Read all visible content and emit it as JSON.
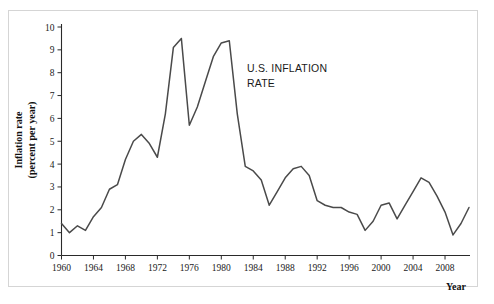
{
  "chart_data": {
    "type": "line",
    "title": "",
    "annotation": "U.S. INFLATION RATE",
    "annotation_lines": [
      "U.S. INFLATION",
      "RATE"
    ],
    "xlabel": "Year",
    "ylabel": "Inflation rate (percent per year)",
    "ylabel_lines": [
      "Inflation rate",
      "(percent per year)"
    ],
    "xlim": [
      1960,
      2011
    ],
    "ylim": [
      0,
      10
    ],
    "grid": false,
    "legend": null,
    "line_color": "#4a4a4a",
    "x_tick_labels": [
      "1960",
      "1964",
      "1968",
      "1972",
      "1976",
      "1980",
      "1984",
      "1988",
      "1992",
      "1996",
      "2000",
      "2004",
      "2008"
    ],
    "x_ticks": [
      1960,
      1964,
      1968,
      1972,
      1976,
      1980,
      1984,
      1988,
      1992,
      1996,
      2000,
      2004,
      2008
    ],
    "y_tick_labels": [
      "0",
      "1",
      "2",
      "3",
      "4",
      "5",
      "6",
      "7",
      "8",
      "9",
      "10"
    ],
    "y_ticks": [
      0,
      1,
      2,
      3,
      4,
      5,
      6,
      7,
      8,
      9,
      10
    ],
    "x": [
      1960,
      1961,
      1962,
      1963,
      1964,
      1965,
      1966,
      1967,
      1968,
      1969,
      1970,
      1971,
      1972,
      1973,
      1974,
      1975,
      1976,
      1977,
      1978,
      1979,
      1980,
      1981,
      1982,
      1983,
      1984,
      1985,
      1986,
      1987,
      1988,
      1989,
      1990,
      1991,
      1992,
      1993,
      1994,
      1995,
      1996,
      1997,
      1998,
      1999,
      2000,
      2001,
      2002,
      2003,
      2004,
      2005,
      2006,
      2007,
      2008,
      2009,
      2010,
      2011
    ],
    "values": [
      1.4,
      1.0,
      1.3,
      1.1,
      1.7,
      2.1,
      2.9,
      3.1,
      4.2,
      5.0,
      5.3,
      4.9,
      4.3,
      6.2,
      9.1,
      9.5,
      5.7,
      6.5,
      7.6,
      8.7,
      9.3,
      9.4,
      6.2,
      3.9,
      3.7,
      3.3,
      2.2,
      2.8,
      3.4,
      3.8,
      3.9,
      3.5,
      2.4,
      2.2,
      2.1,
      2.1,
      1.9,
      1.8,
      1.1,
      1.5,
      2.2,
      2.3,
      1.6,
      2.2,
      2.8,
      3.4,
      3.2,
      2.6,
      1.9,
      0.9,
      1.4,
      2.1
    ],
    "series_name": "U.S. Inflation Rate"
  }
}
